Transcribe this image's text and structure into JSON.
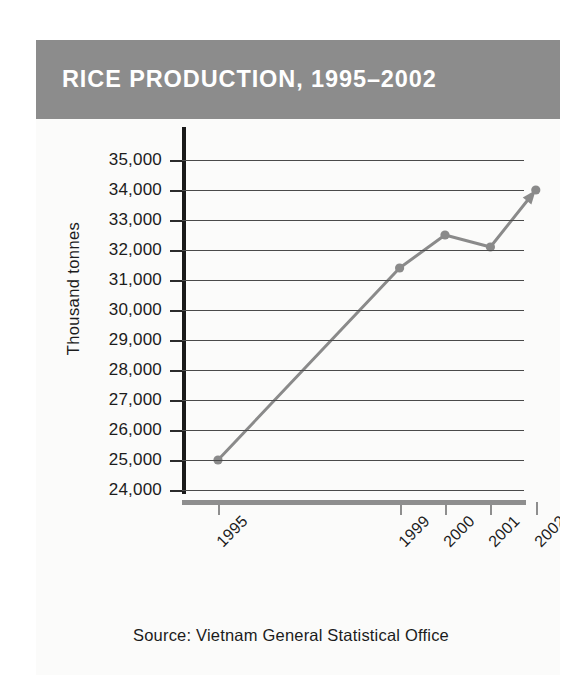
{
  "title": "RICE PRODUCTION, 1995–2002",
  "source_note": "Source: Vietnam General Statistical Office",
  "colors": {
    "banner": "#8c8c8c",
    "banner_text": "#ffffff",
    "series": "#8a8a8a",
    "gridline": "#4a4a4a",
    "yaxis": "#1a1a1a",
    "xaxis": "#8e8e8e",
    "text": "#1c1c1c",
    "page_background": "#ffffff",
    "card_background": "#fbfbfa"
  },
  "chart_data": {
    "type": "line",
    "title": "RICE PRODUCTION, 1995–2002",
    "xlabel": "",
    "ylabel": "Thousand tonnes",
    "ylim": [
      24000,
      35000
    ],
    "ytick_labels": [
      "35,000",
      "34,000",
      "33,000",
      "32,000",
      "31,000",
      "30,000",
      "29,000",
      "28,000",
      "27,000",
      "26,000",
      "25,000",
      "24,000"
    ],
    "ytick_values": [
      35000,
      34000,
      33000,
      32000,
      31000,
      30000,
      29000,
      28000,
      27000,
      26000,
      25000,
      24000
    ],
    "xtick_labels": [
      "1995",
      "1999",
      "2000",
      "2001",
      "2002"
    ],
    "x": [
      1995,
      1999,
      2000,
      2001,
      2002
    ],
    "categories": [
      "1995",
      "1999",
      "2000",
      "2001",
      "2002"
    ],
    "values": [
      25000,
      31400,
      32500,
      32100,
      34000
    ],
    "series": [
      {
        "name": "Rice production",
        "values": [
          25000,
          31400,
          32500,
          32100,
          34000
        ]
      }
    ],
    "grid": true,
    "grid_axis": "y",
    "legend": false,
    "legend_position": "none",
    "marker": "circle",
    "line_end_arrow": true,
    "xlim": [
      1995,
      2002
    ],
    "annotations": [
      "Source: Vietnam General Statistical Office"
    ]
  }
}
